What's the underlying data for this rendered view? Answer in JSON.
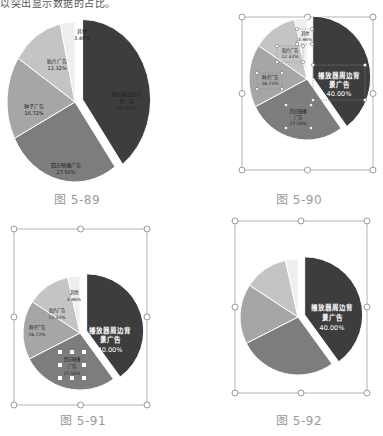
{
  "header": {
    "text": "以突出显示数据的占比。"
  },
  "colors": {
    "slice_player": "#3d3d3d",
    "slice_frame": "#7d7d7d",
    "slice_seed": "#a6a6a6",
    "slice_sticker": "#c4c4c4",
    "slice_other": "#eeeeee",
    "handle": "#9a9a9a",
    "caption": "#9a9a9a"
  },
  "figures": [
    {
      "id": "fig-5-89",
      "caption": "图 5-89"
    },
    {
      "id": "fig-5-90",
      "caption": "图 5-90"
    },
    {
      "id": "fig-5-91",
      "caption": "图 5-91"
    },
    {
      "id": "fig-5-92",
      "caption": "图 5-92"
    }
  ],
  "labels": {
    "player": {
      "line1": "播放器周边背",
      "line2": "景广告",
      "pct": "40.00%"
    },
    "frame": {
      "line1": "四方映播广告",
      "line1b": "四方映播",
      "line2b": "广告",
      "pct": "27.50%"
    },
    "seed": {
      "line1": "种子广告",
      "pct": "16.72%"
    },
    "sticker": {
      "line1": "贴片广告",
      "pct": "12.32%"
    },
    "other": {
      "line1": "其他",
      "pct": "3.46%"
    }
  },
  "chart_data": [
    {
      "type": "pie",
      "title": "图 5-89",
      "categories": [
        "播放器周边背景广告",
        "四方映播广告",
        "种子广告",
        "贴片广告",
        "其他"
      ],
      "values": [
        40.0,
        27.5,
        16.72,
        12.32,
        3.46
      ],
      "exploded": [
        "播放器周边背景广告"
      ],
      "legend": "none",
      "data_labels": "inside, category + percent, small dark text"
    },
    {
      "type": "pie",
      "title": "图 5-90",
      "categories": [
        "播放器周边背景广告",
        "四方映播广告",
        "种子广告",
        "贴片广告",
        "其他"
      ],
      "values": [
        40.0,
        27.5,
        16.72,
        12.32,
        3.46
      ],
      "exploded": [
        "播放器周边背景广告"
      ],
      "state": "chart selected, all data labels selected",
      "data_labels": "largest slice label enlarged, white text"
    },
    {
      "type": "pie",
      "title": "图 5-91",
      "categories": [
        "播放器周边背景广告",
        "四方映播广告",
        "种子广告",
        "贴片广告",
        "其他"
      ],
      "values": [
        40.0,
        27.5,
        16.72,
        12.32,
        3.46
      ],
      "exploded": [
        "播放器周边背景广告"
      ],
      "state": "chart selected, 四方映播广告 label selected"
    },
    {
      "type": "pie",
      "title": "图 5-92",
      "categories": [
        "播放器周边背景广告",
        "四方映播广告",
        "种子广告",
        "贴片广告",
        "其他"
      ],
      "values": [
        40.0,
        27.5,
        16.72,
        12.32,
        3.46
      ],
      "exploded": [
        "播放器周边背景广告"
      ],
      "state": "chart selected, only largest slice labeled"
    }
  ]
}
